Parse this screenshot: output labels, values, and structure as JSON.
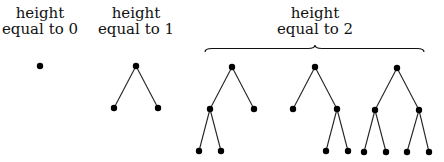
{
  "labels": [
    {
      "line1": "height",
      "line2": "equal to 0",
      "x": 40,
      "y": 5
    },
    {
      "line1": "height",
      "line2": "equal to 1",
      "x": 136,
      "y": 5
    },
    {
      "line1": "height",
      "line2": "equal to 2",
      "x": 315,
      "y": 5
    }
  ],
  "colors": {
    "node": "#000000",
    "edge": "#222222",
    "text": "#111111"
  },
  "trees": [
    {
      "name": "height-0",
      "nodes": [
        [
          40,
          66
        ]
      ],
      "edges": []
    },
    {
      "name": "height-1",
      "nodes": [
        [
          136,
          66
        ],
        [
          114,
          108
        ],
        [
          158,
          108
        ]
      ],
      "edges": [
        [
          0,
          1
        ],
        [
          0,
          2
        ]
      ]
    },
    {
      "name": "height-2-left",
      "nodes": [
        [
          232,
          67
        ],
        [
          210,
          109
        ],
        [
          254,
          109
        ],
        [
          199,
          151
        ],
        [
          221,
          151
        ]
      ],
      "edges": [
        [
          0,
          1
        ],
        [
          0,
          2
        ],
        [
          1,
          3
        ],
        [
          1,
          4
        ]
      ]
    },
    {
      "name": "height-2-right",
      "nodes": [
        [
          315,
          67
        ],
        [
          293,
          109
        ],
        [
          337,
          109
        ],
        [
          326,
          151
        ],
        [
          348,
          151
        ]
      ],
      "edges": [
        [
          0,
          1
        ],
        [
          0,
          2
        ],
        [
          2,
          3
        ],
        [
          2,
          4
        ]
      ]
    },
    {
      "name": "height-2-full",
      "nodes": [
        [
          397,
          68
        ],
        [
          375,
          110
        ],
        [
          419,
          110
        ],
        [
          364,
          152
        ],
        [
          386,
          152
        ],
        [
          407,
          152
        ],
        [
          429,
          152
        ]
      ],
      "edges": [
        [
          0,
          1
        ],
        [
          0,
          2
        ],
        [
          1,
          3
        ],
        [
          1,
          4
        ],
        [
          2,
          5
        ],
        [
          2,
          6
        ]
      ]
    }
  ],
  "brace": {
    "x1": 205,
    "x2": 424,
    "y": 52,
    "tip": 315
  }
}
